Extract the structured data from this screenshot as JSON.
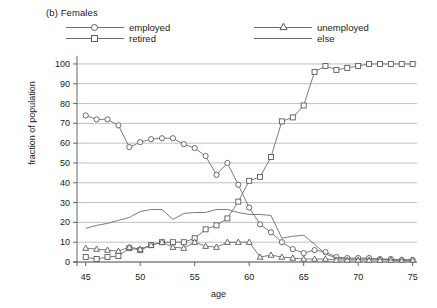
{
  "panel": {
    "title": "(b) Females"
  },
  "legend": {
    "position": "top",
    "items": [
      {
        "label": "employed",
        "marker": "circle",
        "key_name": "legend-key-employed"
      },
      {
        "label": "unemployed",
        "marker": "triangle",
        "key_name": "legend-key-unemployed"
      },
      {
        "label": "retired",
        "marker": "square",
        "key_name": "legend-key-retired"
      },
      {
        "label": "else",
        "marker": "none",
        "key_name": "legend-key-else"
      }
    ]
  },
  "colors": {
    "line": "#6d6d6d",
    "marker_stroke": "#5a5a5a",
    "marker_fill": "#ffffff",
    "grid": "#b9b9b9",
    "axis": "#555555",
    "text": "#1a1a1a",
    "background": "#ffffff"
  },
  "axes": {
    "y_ticks": [
      "0",
      "10",
      "20",
      "30",
      "40",
      "50",
      "60",
      "70",
      "80",
      "90",
      "100"
    ],
    "x_ticks": [
      "45",
      "50",
      "55",
      "60",
      "65",
      "70",
      "75"
    ]
  },
  "chart_data": {
    "type": "line",
    "title": "(b) Females",
    "xlabel": "age",
    "ylabel": "fraction of population",
    "xlim": [
      44.2,
      75.4
    ],
    "ylim": [
      0,
      103
    ],
    "grid": true,
    "legend_position": "top",
    "x": [
      45,
      46,
      47,
      48,
      49,
      50,
      51,
      52,
      53,
      54,
      55,
      56,
      57,
      58,
      59,
      60,
      61,
      62,
      63,
      64,
      65,
      66,
      67,
      68,
      69,
      70,
      71,
      72,
      73,
      74,
      75
    ],
    "series": [
      {
        "name": "employed",
        "marker": "circle",
        "values": [
          74,
          72,
          72,
          69,
          58,
          60.5,
          62,
          62.5,
          62.5,
          59.5,
          57.5,
          53.5,
          44,
          50,
          39,
          27.5,
          19,
          15,
          10,
          6.5,
          4.5,
          6,
          5,
          2.5,
          2,
          2,
          2,
          1.5,
          1.5,
          1,
          1
        ]
      },
      {
        "name": "retired",
        "marker": "square",
        "values": [
          2.5,
          1.5,
          2.5,
          3,
          7,
          6,
          8.5,
          10,
          10,
          10,
          12,
          16.5,
          18.5,
          22,
          30.5,
          41,
          43,
          53,
          71,
          73,
          79,
          96,
          99,
          97,
          98,
          99,
          100,
          100,
          100,
          100,
          100
        ]
      },
      {
        "name": "unemployed",
        "marker": "triangle",
        "values": [
          7,
          6.5,
          6,
          5.5,
          7.5,
          6.5,
          8.5,
          10,
          7.5,
          7,
          10,
          8,
          7.5,
          10,
          10,
          10,
          2.5,
          3.5,
          2.5,
          2,
          1.5,
          1.5,
          1.5,
          1,
          1,
          1,
          1,
          1,
          1,
          1,
          1
        ]
      },
      {
        "name": "else",
        "marker": "none",
        "values": [
          17,
          18.5,
          19.5,
          21,
          22.5,
          25.5,
          26.5,
          26.5,
          21.5,
          24.5,
          25,
          25,
          26.5,
          26.5,
          25,
          24,
          24,
          23.5,
          12,
          13,
          13.5,
          9,
          4,
          2,
          1.5,
          1.5,
          1.5,
          1.5,
          1,
          1,
          1
        ]
      }
    ]
  }
}
